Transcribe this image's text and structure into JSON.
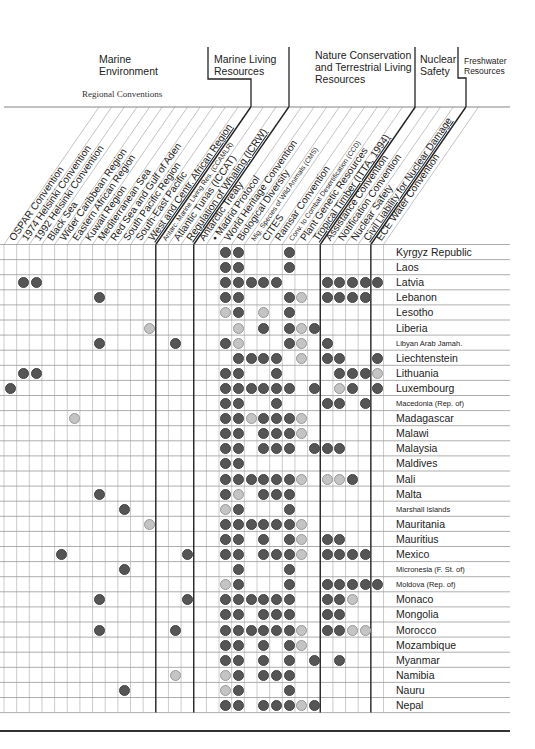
{
  "groups": [
    {
      "id": "marine_env",
      "title": "Marine Environment",
      "lines": [
        "Marine",
        "Environment"
      ]
    },
    {
      "id": "marine_living",
      "title": "Marine Living Resources",
      "lines": [
        "Marine Living",
        "Resources"
      ]
    },
    {
      "id": "nature",
      "title": "Nature Conservation and Terrestrial Living Resources",
      "lines": [
        "Nature Conservation",
        "and Terrestrial Living",
        "Resources"
      ]
    },
    {
      "id": "nuclear",
      "title": "Nuclear Safety",
      "lines": [
        "Nuclear",
        "Safety"
      ]
    },
    {
      "id": "freshwater",
      "title": "Freshwater Resources",
      "lines": [
        "Freshwater",
        "Resources"
      ]
    }
  ],
  "subtitle": "Regional Conventions",
  "columns": [
    {
      "label": "OSPAR Convention",
      "group": "marine_env",
      "size": "normal"
    },
    {
      "label": "1974 Helsinki Convention",
      "group": "marine_env",
      "size": "normal"
    },
    {
      "label": "1992 Helsinki Convention",
      "group": "marine_env",
      "size": "normal"
    },
    {
      "label": "Black Sea",
      "group": "marine_env",
      "size": "normal"
    },
    {
      "label": "Wider Caribbean Region",
      "group": "marine_env",
      "size": "normal"
    },
    {
      "label": "Eastern African Region",
      "group": "marine_env",
      "size": "normal"
    },
    {
      "label": "Kuwait Region",
      "group": "marine_env",
      "size": "normal"
    },
    {
      "label": "Mediterranean Sea",
      "group": "marine_env",
      "size": "normal"
    },
    {
      "label": "Red Sea and Gulf of Aden",
      "group": "marine_env",
      "size": "normal"
    },
    {
      "label": "South Pacific Region",
      "group": "marine_env",
      "size": "normal"
    },
    {
      "label": "South-East Pacific",
      "group": "marine_env",
      "size": "normal"
    },
    {
      "label": "West and Centr. African Region",
      "group": "marine_env",
      "size": "normal",
      "underline": true
    },
    {
      "label": "Antarc. Marine Living Res. (CCAMLR)",
      "group": "marine_living",
      "size": "small"
    },
    {
      "label": "Atlantic Tunas (ICCAT)",
      "group": "marine_living",
      "size": "normal"
    },
    {
      "label": "Regulation of Whaling (ICRW)",
      "group": "marine_living",
      "size": "normal",
      "underline": true
    },
    {
      "label": "Antarctic Treaty",
      "group": "nature",
      "size": "normal"
    },
    {
      "label": "• Madrid Protocol",
      "group": "nature",
      "size": "normal"
    },
    {
      "label": "World Heritage Convention",
      "group": "nature",
      "size": "normal"
    },
    {
      "label": "Biological Diversity",
      "group": "nature",
      "size": "normal"
    },
    {
      "label": "Mig. Species of Wild Animals (CMS)",
      "group": "nature",
      "size": "small"
    },
    {
      "label": "CITES",
      "group": "nature",
      "size": "normal"
    },
    {
      "label": "Ramsar Convention",
      "group": "nature",
      "size": "normal"
    },
    {
      "label": "Conv. to Combat Desertification (CCD)",
      "group": "nature",
      "size": "small"
    },
    {
      "label": "Plant Genetic Resources",
      "group": "nature",
      "size": "normal"
    },
    {
      "label": "Tropical Timber (ITTA, 1994)",
      "group": "nature",
      "size": "normal",
      "underline": true
    },
    {
      "label": "Assistance Convention",
      "group": "nuclear",
      "size": "normal"
    },
    {
      "label": "Notification Convention",
      "group": "nuclear",
      "size": "normal"
    },
    {
      "label": "Nuclear Safety",
      "group": "nuclear",
      "size": "normal"
    },
    {
      "label": "Civil Liability for Nuclear Damage",
      "group": "nuclear",
      "size": "normal",
      "underline": true
    },
    {
      "label": "ECE Water Convention",
      "group": "freshwater",
      "size": "normal"
    }
  ],
  "legend": {
    "dark": "#555555",
    "light": "#c4c4c4"
  },
  "rows": [
    {
      "country": "Kyrgyz Republic",
      "size": "normal",
      "dark": [
        18,
        19,
        23
      ],
      "light": []
    },
    {
      "country": "Laos",
      "size": "normal",
      "dark": [
        18,
        19,
        23
      ],
      "light": []
    },
    {
      "country": "Latvia",
      "size": "normal",
      "dark": [
        2,
        3,
        18,
        19,
        20,
        21,
        22,
        26,
        27,
        28,
        29,
        30
      ],
      "light": []
    },
    {
      "country": "Lebanon",
      "size": "normal",
      "dark": [
        8,
        18,
        19,
        23,
        26,
        27,
        28,
        29
      ],
      "light": [
        24
      ]
    },
    {
      "country": "Lesotho",
      "size": "normal",
      "dark": [
        19,
        23
      ],
      "light": [
        18,
        21
      ]
    },
    {
      "country": "Liberia",
      "size": "normal",
      "dark": [
        21,
        23,
        25
      ],
      "light": [
        12,
        19,
        24
      ]
    },
    {
      "country": "Libyan Arab Jamah.",
      "size": "small",
      "dark": [
        8,
        14,
        18,
        23,
        26
      ],
      "light": [
        19,
        24
      ]
    },
    {
      "country": "Liechtenstein",
      "size": "normal",
      "dark": [
        19,
        20,
        21,
        22,
        26,
        27,
        30
      ],
      "light": [
        24
      ]
    },
    {
      "country": "Lithuania",
      "size": "normal",
      "dark": [
        2,
        3,
        18,
        19,
        22,
        27,
        28,
        29
      ],
      "light": [
        30
      ]
    },
    {
      "country": "Luxembourg",
      "size": "normal",
      "dark": [
        1,
        18,
        19,
        20,
        21,
        22,
        23,
        25,
        28,
        30
      ],
      "light": [
        27
      ]
    },
    {
      "country": "Macedonia (Rep. of)",
      "size": "small",
      "dark": [
        18,
        19,
        22,
        26,
        27,
        29
      ],
      "light": []
    },
    {
      "country": "Madagascar",
      "size": "normal",
      "dark": [
        18,
        19,
        21,
        22,
        23
      ],
      "light": [
        6,
        20,
        24
      ]
    },
    {
      "country": "Malawi",
      "size": "normal",
      "dark": [
        18,
        19,
        21,
        22,
        23
      ],
      "light": [
        24
      ]
    },
    {
      "country": "Malaysia",
      "size": "normal",
      "dark": [
        18,
        19,
        21,
        22,
        23,
        25,
        26,
        27
      ],
      "light": []
    },
    {
      "country": "Maldives",
      "size": "normal",
      "dark": [
        18,
        19
      ],
      "light": []
    },
    {
      "country": "Mali",
      "size": "normal",
      "dark": [
        18,
        19,
        20,
        21,
        22,
        23,
        28
      ],
      "light": [
        24,
        26,
        27
      ]
    },
    {
      "country": "Malta",
      "size": "normal",
      "dark": [
        8,
        18,
        21,
        22,
        23
      ],
      "light": [
        19
      ]
    },
    {
      "country": "Marshall Islands",
      "size": "small",
      "dark": [
        10,
        19,
        23
      ],
      "light": [
        18
      ]
    },
    {
      "country": "Mauritania",
      "size": "normal",
      "dark": [
        18,
        19,
        20,
        21,
        22,
        23
      ],
      "light": [
        12,
        24
      ]
    },
    {
      "country": "Mauritius",
      "size": "normal",
      "dark": [
        18,
        19,
        21,
        23,
        26,
        27
      ],
      "light": [
        24
      ]
    },
    {
      "country": "Mexico",
      "size": "normal",
      "dark": [
        5,
        15,
        18,
        19,
        21,
        22,
        23,
        26,
        27,
        28,
        29
      ],
      "light": [
        24
      ]
    },
    {
      "country": "Micronesia (F. St. of)",
      "size": "small",
      "dark": [
        10,
        19,
        23
      ],
      "light": []
    },
    {
      "country": "Moldova (Rep. of)",
      "size": "small",
      "dark": [
        19,
        23,
        26,
        27,
        28,
        29,
        30
      ],
      "light": [
        18
      ]
    },
    {
      "country": "Monaco",
      "size": "normal",
      "dark": [
        8,
        15,
        18,
        19,
        20,
        21,
        22,
        23,
        26,
        27
      ],
      "light": [
        28
      ]
    },
    {
      "country": "Mongolia",
      "size": "normal",
      "dark": [
        18,
        19,
        21,
        22,
        23,
        26,
        27
      ],
      "light": []
    },
    {
      "country": "Morocco",
      "size": "normal",
      "dark": [
        8,
        14,
        18,
        19,
        20,
        21,
        22,
        23,
        26,
        27
      ],
      "light": [
        24,
        28,
        29
      ]
    },
    {
      "country": "Mozambique",
      "size": "normal",
      "dark": [
        18,
        19,
        21,
        23
      ],
      "light": [
        24
      ]
    },
    {
      "country": "Myanmar",
      "size": "normal",
      "dark": [
        18,
        19,
        21,
        23,
        25,
        27
      ],
      "light": []
    },
    {
      "country": "Namibia",
      "size": "normal",
      "dark": [
        19,
        21,
        22,
        23
      ],
      "light": [
        14,
        18
      ]
    },
    {
      "country": "Nauru",
      "size": "normal",
      "dark": [
        10,
        19,
        23
      ],
      "light": [
        18
      ]
    },
    {
      "country": "Nepal",
      "size": "normal",
      "dark": [
        18,
        19,
        21,
        22,
        23,
        25
      ],
      "light": [
        24
      ]
    }
  ]
}
